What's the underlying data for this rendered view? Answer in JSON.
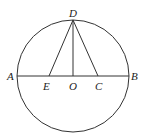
{
  "diagram": {
    "type": "geometry",
    "circle": {
      "center": "O",
      "cx": 73,
      "cy": 76,
      "r": 56
    },
    "points": {
      "A": {
        "label": "A",
        "x": 17,
        "y": 76
      },
      "B": {
        "label": "B",
        "x": 129,
        "y": 76
      },
      "D": {
        "label": "D",
        "x": 73,
        "y": 20
      },
      "E": {
        "label": "E",
        "x": 49,
        "y": 76
      },
      "O": {
        "label": "O",
        "x": 73,
        "y": 76
      },
      "C": {
        "label": "C",
        "x": 98,
        "y": 76
      }
    },
    "segments": [
      [
        "A",
        "B"
      ],
      [
        "D",
        "E"
      ],
      [
        "D",
        "O"
      ],
      [
        "D",
        "C"
      ]
    ],
    "stroke_color": "#333333"
  }
}
